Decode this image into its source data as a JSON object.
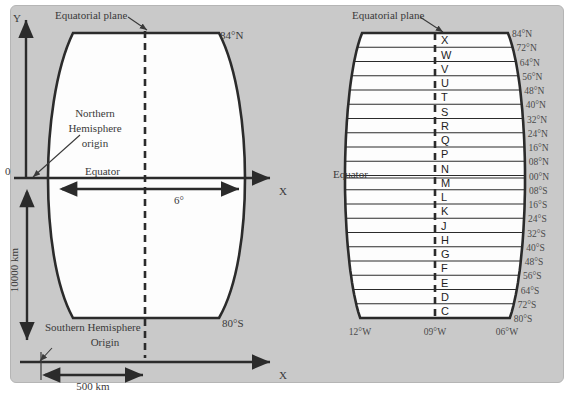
{
  "figure": {
    "background_color": "#c9c9c9",
    "outline_color": "#2b2b2b"
  },
  "left_panel": {
    "title_annotation": "Equatorial plane",
    "axis_y_label": "Y",
    "axis_x_label": "X",
    "origin_label": "0",
    "equator_label": "Equator",
    "region_label_line1": "Northern",
    "region_label_line2": "Hemisphere",
    "region_label_line3": "origin",
    "top_latitude": "84°N",
    "bottom_latitude": "80°S",
    "width_dimension": "6°",
    "height_dimension": "10000 km",
    "offset_dimension": "500 km",
    "southern_origin_line1": "Southern Hemisphere",
    "southern_origin_line2": "Origin",
    "lower_axis_x_label": "X"
  },
  "right_panel": {
    "title_annotation": "Equatorial plane",
    "equator_label": "Equator",
    "bands": [
      {
        "letter": "X",
        "latitude": "84°N"
      },
      {
        "letter": "W",
        "latitude": "72°N"
      },
      {
        "letter": "V",
        "latitude": "64°N"
      },
      {
        "letter": "U",
        "latitude": "56°N"
      },
      {
        "letter": "T",
        "latitude": "48°N"
      },
      {
        "letter": "S",
        "latitude": "40°N"
      },
      {
        "letter": "R",
        "latitude": "32°N"
      },
      {
        "letter": "Q",
        "latitude": "24°N"
      },
      {
        "letter": "P",
        "latitude": "16°N"
      },
      {
        "letter": "N",
        "latitude": "08°N"
      },
      {
        "letter": "M",
        "latitude": "00°N"
      },
      {
        "letter": "L",
        "latitude": "08°S"
      },
      {
        "letter": "K",
        "latitude": "16°S"
      },
      {
        "letter": "J",
        "latitude": "24°S"
      },
      {
        "letter": "H",
        "latitude": "32°S"
      },
      {
        "letter": "G",
        "latitude": "40°S"
      },
      {
        "letter": "F",
        "latitude": "48°S"
      },
      {
        "letter": "E",
        "latitude": "56°S"
      },
      {
        "letter": "D",
        "latitude": "64°S"
      },
      {
        "letter": "C",
        "latitude": "72°S"
      }
    ],
    "bottom_latitude": "80°S",
    "longitudes": [
      "12°W",
      "09°W",
      "06°W"
    ]
  }
}
